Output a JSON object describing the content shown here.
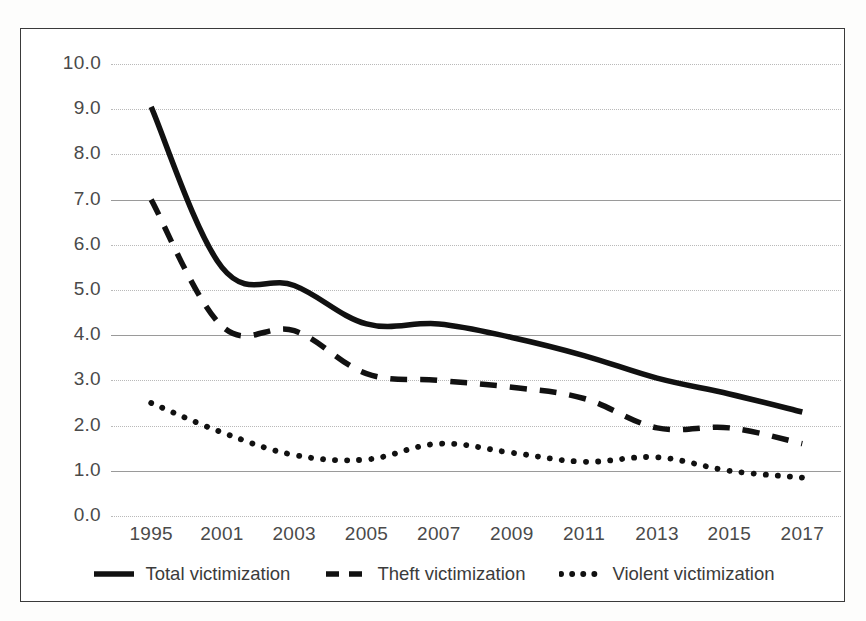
{
  "chart_data": {
    "type": "line",
    "title": "",
    "subtitle": "",
    "xlabel": "",
    "ylabel": "",
    "x": [
      "1995",
      "2001",
      "2003",
      "2005",
      "2007",
      "2009",
      "2011",
      "2013",
      "2015",
      "2017"
    ],
    "xtick_labels": [
      "1995",
      "2001",
      "2003",
      "2005",
      "2007",
      "2009",
      "2011",
      "2013",
      "2015",
      "2017"
    ],
    "ytick_labels": [
      "10.0",
      "9.0",
      "8.0",
      "7.0",
      "6.0",
      "5.0",
      "4.0",
      "3.0",
      "2.0",
      "1.0",
      "0.0"
    ],
    "ylim": [
      0.0,
      10.0
    ],
    "ytick_values": [
      10.0,
      9.0,
      8.0,
      7.0,
      6.0,
      5.0,
      4.0,
      3.0,
      2.0,
      1.0,
      0.0
    ],
    "grid": true,
    "grid_major_values": [
      7.0,
      4.0,
      1.0
    ],
    "legend_position": "bottom",
    "series": [
      {
        "name": "Total victimization",
        "style": "solid",
        "color": "#111111",
        "values": [
          9.05,
          5.5,
          5.1,
          4.25,
          4.25,
          3.95,
          3.55,
          3.05,
          2.7,
          2.3
        ]
      },
      {
        "name": "Theft victimization",
        "style": "dashed",
        "color": "#111111",
        "values": [
          7.0,
          4.2,
          4.1,
          3.15,
          3.0,
          2.85,
          2.6,
          1.95,
          1.95,
          1.6
        ]
      },
      {
        "name": "Violent victimization",
        "style": "dotted",
        "color": "#111111",
        "values": [
          2.5,
          1.85,
          1.35,
          1.25,
          1.6,
          1.4,
          1.2,
          1.3,
          1.0,
          0.85
        ]
      }
    ]
  },
  "legend": {
    "entries": [
      {
        "label": "Total victimization",
        "style": "solid"
      },
      {
        "label": "Theft victimization",
        "style": "dashed"
      },
      {
        "label": "Violent victimization",
        "style": "dotted"
      }
    ]
  },
  "colors": {
    "line": "#111111",
    "grid_minor": "#b9b9b9",
    "grid_major": "#9a9a9a",
    "border": "#3a3a3a",
    "tick_text": "#4a4a4a",
    "background": "#ffffff"
  }
}
